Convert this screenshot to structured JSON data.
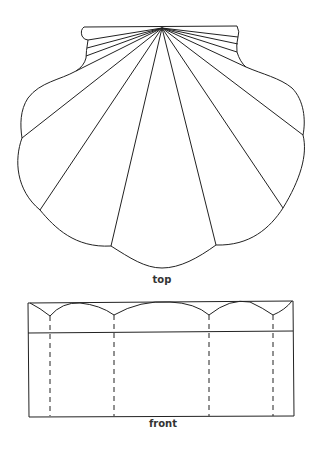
{
  "diagram": {
    "views": [
      {
        "id": "top",
        "label": "top"
      },
      {
        "id": "front",
        "label": "front"
      }
    ],
    "colors": {
      "stroke": "#222222",
      "label": "#333333",
      "background": "#ffffff"
    }
  }
}
